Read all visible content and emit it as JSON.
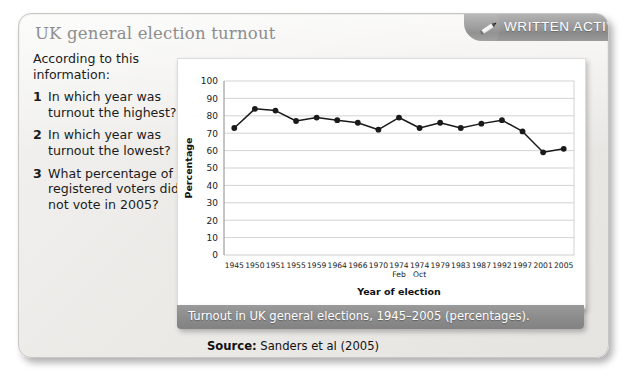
{
  "card": {
    "title": "UK general election turnout"
  },
  "activity_banner": {
    "label": "WRITTEN ACTIVITY",
    "icon": "pencil-icon",
    "bg_color": "#8a8a8a",
    "text_color": "#ffffff"
  },
  "questions": {
    "intro": "According to this information:",
    "items": [
      {
        "number": "1",
        "text": "In which year was turnout the highest?"
      },
      {
        "number": "2",
        "text": "In which year was turnout the lowest?"
      },
      {
        "number": "3",
        "text": "What percentage of registered voters did not vote in 2005?"
      }
    ]
  },
  "caption": "Turnout in UK general elections, 1945–2005 (percentages).",
  "source": {
    "label": "Source:",
    "text": "Sanders et al (2005)"
  },
  "chart_data": {
    "type": "line",
    "title": "",
    "xlabel": "Year of election",
    "ylabel": "Percentage",
    "ylim": [
      0,
      100
    ],
    "yticks": [
      0,
      10,
      20,
      30,
      40,
      50,
      60,
      70,
      80,
      90,
      100
    ],
    "grid": true,
    "legend": false,
    "marker": "filled-circle",
    "line_color": "#1a1a1a",
    "categories": [
      "1945",
      "1950",
      "1951",
      "1955",
      "1959",
      "1964",
      "1966",
      "1970",
      "1974 Feb",
      "1974 Oct",
      "1979",
      "1983",
      "1987",
      "1992",
      "1997",
      "2001",
      "2005"
    ],
    "tick_labels_line1": [
      "1945",
      "1950",
      "1951",
      "1955",
      "1959",
      "1964",
      "1966",
      "1970",
      "1974",
      "1974",
      "1979",
      "1983",
      "1987",
      "1992",
      "1997",
      "2001",
      "2005"
    ],
    "tick_labels_line2": [
      "",
      "",
      "",
      "",
      "",
      "",
      "",
      "",
      "Feb",
      "Oct",
      "",
      "",
      "",
      "",
      "",
      "",
      ""
    ],
    "values": [
      73,
      84,
      83,
      77,
      79,
      77.5,
      76,
      72,
      79,
      73,
      76,
      73,
      75.5,
      77.5,
      71,
      59,
      61
    ]
  }
}
